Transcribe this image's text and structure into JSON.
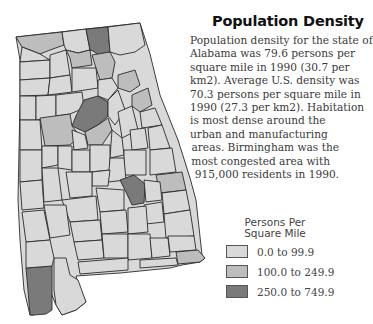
{
  "title": "Population Density",
  "description_lines": [
    "Population density for the state of",
    "Alabama was 79.6 persons per",
    "square mile in 1990 (30.7 per",
    "km2). Average U.S. density was",
    "70.3 persons per square mile in",
    "1990 (27.3 per km2). Habitation",
    "is most dense around the",
    "urban and manufacturing",
    "areas. Birmingham was the",
    "most congested area with",
    "915,000 residents in 1990."
  ],
  "legend": {
    "title": "Persons Per Square Mile",
    "items": [
      {
        "label": "0.0 to 99.9",
        "color": "#d9d9d9"
      },
      {
        "label": "100.0 to 249.9",
        "color": "#bdbdbd"
      },
      {
        "label": "250.0 to 749.9",
        "color": "#7a7a7a"
      }
    ]
  },
  "colors": {
    "low": "#d9d9d9",
    "mid": "#bdbdbd",
    "high": "#7a7a7a",
    "border": "#2a2a2a"
  }
}
